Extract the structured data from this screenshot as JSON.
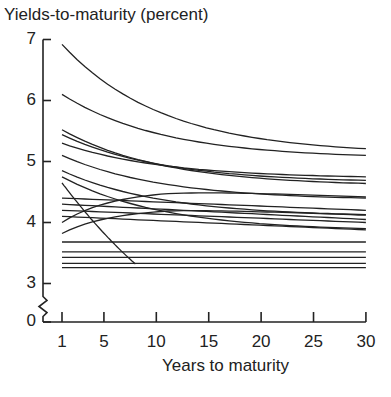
{
  "chart_data": {
    "type": "line",
    "title": "Yields-to-maturity (percent)",
    "xlabel": "Years to maturity",
    "ylabel": "Yields-to-maturity (percent)",
    "x_ticks": [
      1,
      5,
      10,
      15,
      20,
      25,
      30
    ],
    "y_ticks": [
      0,
      3,
      4,
      5,
      6,
      7
    ],
    "y_axis_break": "between 0 and 3",
    "xlim": [
      1,
      30
    ],
    "ylim": [
      3,
      7
    ],
    "grid": false,
    "legend": null,
    "x": [
      1,
      30
    ],
    "series": [
      {
        "name": "curve-1",
        "start": 6.92,
        "end": 5.21,
        "shape": "decreasing"
      },
      {
        "name": "curve-2",
        "start": 6.1,
        "end": 5.1,
        "shape": "decreasing"
      },
      {
        "name": "curve-3",
        "start": 5.52,
        "end": 4.64,
        "shape": "decreasing"
      },
      {
        "name": "curve-4",
        "start": 5.44,
        "end": 4.69,
        "shape": "decreasing"
      },
      {
        "name": "curve-5",
        "start": 5.3,
        "end": 4.75,
        "shape": "decreasing"
      },
      {
        "name": "curve-6",
        "start": 5.1,
        "end": 4.4,
        "shape": "decreasing"
      },
      {
        "name": "curve-7",
        "start": 4.85,
        "end": 4.13,
        "shape": "decreasing"
      },
      {
        "name": "curve-8",
        "start": 4.75,
        "end": 3.9,
        "shape": "decreasing"
      },
      {
        "name": "curve-9",
        "start": 4.65,
        "end": 3.32,
        "end_x": 8,
        "shape": "decreasing-steep"
      },
      {
        "name": "curve-10",
        "start": 4.4,
        "end": 4.2,
        "shape": "flat"
      },
      {
        "name": "curve-11",
        "start": 4.3,
        "end": 4.05,
        "shape": "flat"
      },
      {
        "name": "curve-12",
        "start": 4.2,
        "end": 4.0,
        "shape": "flat"
      },
      {
        "name": "curve-13",
        "start": 4.1,
        "end": 3.88,
        "shape": "flat"
      },
      {
        "name": "curve-14",
        "start": 4.0,
        "end": 4.42,
        "shape": "humped-from-low"
      },
      {
        "name": "curve-15",
        "start": 3.82,
        "end": 4.12,
        "shape": "humped-from-low"
      },
      {
        "name": "curve-16",
        "start": 3.68,
        "end": 3.68,
        "shape": "flat"
      },
      {
        "name": "curve-17",
        "start": 3.52,
        "end": 3.52,
        "shape": "flat"
      },
      {
        "name": "curve-18",
        "start": 3.43,
        "end": 3.43,
        "shape": "flat"
      },
      {
        "name": "curve-19",
        "start": 3.33,
        "end": 3.33,
        "shape": "flat"
      },
      {
        "name": "curve-20",
        "start": 3.26,
        "end": 3.26,
        "shape": "flat"
      }
    ]
  }
}
